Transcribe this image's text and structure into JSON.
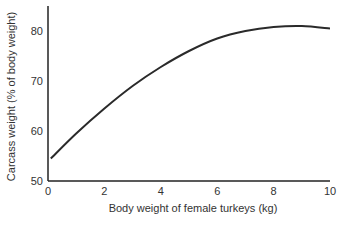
{
  "chart_data": {
    "type": "line",
    "title": "",
    "xlabel": "Body weight of female turkeys (kg)",
    "ylabel": "Carcass weight (% of body weight)",
    "xlim": [
      0,
      10
    ],
    "ylim": [
      50,
      85
    ],
    "xticks": [
      0,
      2,
      4,
      6,
      8,
      10
    ],
    "yticks": [
      50,
      60,
      70,
      80
    ],
    "grid": false,
    "legend": "none",
    "series": [
      {
        "name": "Carcass weight",
        "color": "#2a2a2a",
        "x": [
          0.1,
          1,
          2,
          3,
          4,
          5,
          6,
          7,
          8,
          9,
          10
        ],
        "y": [
          54.5,
          59.5,
          64.5,
          69.0,
          72.8,
          76.0,
          78.5,
          80.0,
          80.8,
          81.0,
          80.5
        ]
      }
    ]
  }
}
